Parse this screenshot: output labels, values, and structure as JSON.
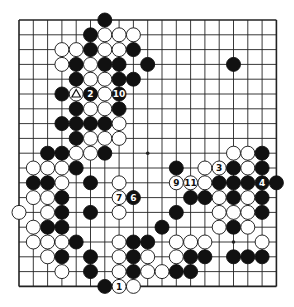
{
  "diagram": {
    "type": "go-board",
    "size": 19,
    "colors": {
      "black": "#111111",
      "white": "#ffffff",
      "line": "#222222",
      "background": "#ffffff"
    },
    "star_points": [
      [
        3,
        3
      ],
      [
        9,
        3
      ],
      [
        15,
        3
      ],
      [
        3,
        9
      ],
      [
        9,
        9
      ],
      [
        15,
        9
      ],
      [
        3,
        15
      ],
      [
        9,
        15
      ],
      [
        15,
        15
      ]
    ],
    "black_stones": [
      [
        6,
        0
      ],
      [
        5,
        1
      ],
      [
        5,
        2
      ],
      [
        8,
        2
      ],
      [
        4,
        3
      ],
      [
        6,
        3
      ],
      [
        7,
        3
      ],
      [
        9,
        3
      ],
      [
        15,
        3
      ],
      [
        4,
        4
      ],
      [
        7,
        4
      ],
      [
        8,
        4
      ],
      [
        3,
        5
      ],
      [
        4,
        6
      ],
      [
        7,
        6
      ],
      [
        3,
        7
      ],
      [
        4,
        7
      ],
      [
        5,
        7
      ],
      [
        6,
        7
      ],
      [
        4,
        8
      ],
      [
        2,
        9
      ],
      [
        3,
        9
      ],
      [
        6,
        9
      ],
      [
        17,
        9
      ],
      [
        4,
        10
      ],
      [
        11,
        10
      ],
      [
        15,
        10
      ],
      [
        17,
        10
      ],
      [
        1,
        11
      ],
      [
        2,
        11
      ],
      [
        5,
        11
      ],
      [
        14,
        11
      ],
      [
        15,
        11
      ],
      [
        16,
        11
      ],
      [
        18,
        11
      ],
      [
        3,
        12
      ],
      [
        12,
        12
      ],
      [
        13,
        12
      ],
      [
        15,
        12
      ],
      [
        17,
        12
      ],
      [
        3,
        13
      ],
      [
        5,
        13
      ],
      [
        11,
        13
      ],
      [
        17,
        13
      ],
      [
        2,
        14
      ],
      [
        3,
        14
      ],
      [
        10,
        14
      ],
      [
        15,
        14
      ],
      [
        4,
        15
      ],
      [
        8,
        15
      ],
      [
        9,
        15
      ],
      [
        3,
        16
      ],
      [
        5,
        16
      ],
      [
        8,
        16
      ],
      [
        12,
        16
      ],
      [
        13,
        16
      ],
      [
        15,
        16
      ],
      [
        16,
        16
      ],
      [
        17,
        16
      ],
      [
        5,
        17
      ],
      [
        8,
        17
      ],
      [
        11,
        17
      ],
      [
        12,
        17
      ],
      [
        6,
        18
      ]
    ],
    "white_stones": [
      [
        6,
        1
      ],
      [
        7,
        1
      ],
      [
        8,
        1
      ],
      [
        3,
        2
      ],
      [
        4,
        2
      ],
      [
        6,
        2
      ],
      [
        7,
        2
      ],
      [
        3,
        3
      ],
      [
        5,
        3
      ],
      [
        5,
        4
      ],
      [
        6,
        4
      ],
      [
        6,
        5
      ],
      [
        5,
        6
      ],
      [
        6,
        6
      ],
      [
        7,
        7
      ],
      [
        5,
        8
      ],
      [
        6,
        8
      ],
      [
        7,
        8
      ],
      [
        4,
        9
      ],
      [
        5,
        9
      ],
      [
        15,
        9
      ],
      [
        16,
        9
      ],
      [
        1,
        10
      ],
      [
        2,
        10
      ],
      [
        3,
        10
      ],
      [
        13,
        10
      ],
      [
        16,
        10
      ],
      [
        3,
        11
      ],
      [
        7,
        11
      ],
      [
        13,
        11
      ],
      [
        1,
        12
      ],
      [
        2,
        12
      ],
      [
        14,
        12
      ],
      [
        16,
        12
      ],
      [
        0,
        13
      ],
      [
        2,
        13
      ],
      [
        7,
        13
      ],
      [
        14,
        13
      ],
      [
        15,
        13
      ],
      [
        16,
        13
      ],
      [
        1,
        14
      ],
      [
        14,
        14
      ],
      [
        16,
        14
      ],
      [
        1,
        15
      ],
      [
        2,
        15
      ],
      [
        3,
        15
      ],
      [
        7,
        15
      ],
      [
        11,
        15
      ],
      [
        12,
        15
      ],
      [
        13,
        15
      ],
      [
        17,
        15
      ],
      [
        2,
        16
      ],
      [
        7,
        16
      ],
      [
        9,
        16
      ],
      [
        11,
        16
      ],
      [
        3,
        17
      ],
      [
        7,
        17
      ],
      [
        9,
        17
      ],
      [
        10,
        17
      ],
      [
        8,
        18
      ]
    ],
    "numbered_moves": [
      {
        "n": "1",
        "color": "white",
        "pos": [
          7,
          18
        ]
      },
      {
        "n": "2",
        "color": "black",
        "pos": [
          5,
          5
        ]
      },
      {
        "n": "3",
        "color": "white",
        "pos": [
          14,
          10
        ]
      },
      {
        "n": "4",
        "color": "black",
        "pos": [
          17,
          11
        ]
      },
      {
        "n": "6",
        "color": "black",
        "pos": [
          8,
          12
        ]
      },
      {
        "n": "7",
        "color": "white",
        "pos": [
          7,
          12
        ]
      },
      {
        "n": "9",
        "color": "white",
        "pos": [
          11,
          11
        ]
      },
      {
        "n": "10",
        "color": "black",
        "pos": [
          7,
          5
        ]
      },
      {
        "n": "11",
        "color": "white",
        "pos": [
          12,
          11
        ]
      }
    ],
    "marked_stones": [
      {
        "mark": "triangle",
        "color": "white",
        "pos": [
          4,
          5
        ]
      }
    ]
  }
}
